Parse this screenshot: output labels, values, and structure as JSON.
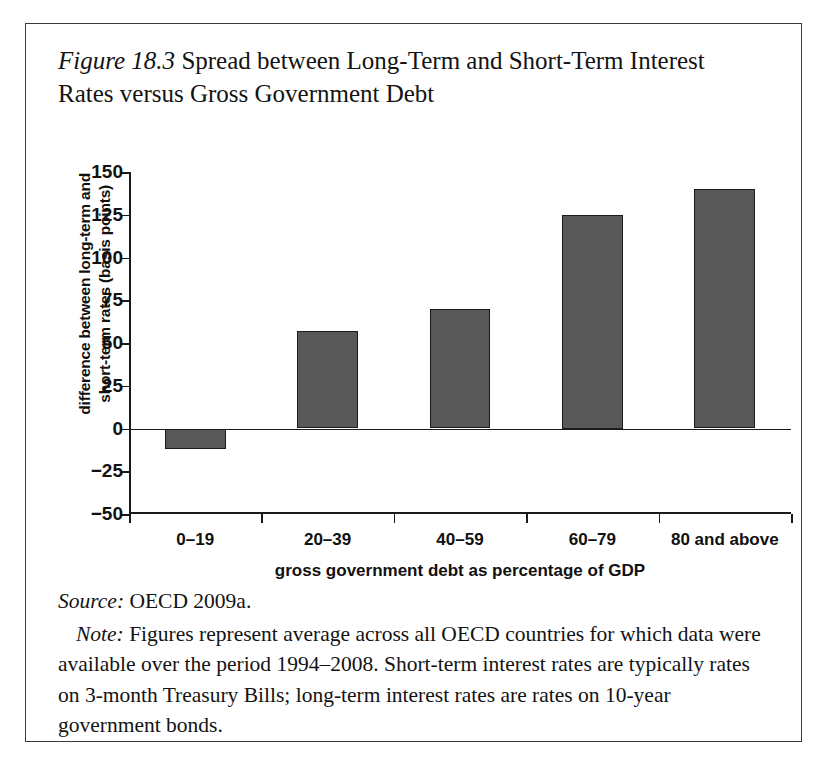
{
  "figure": {
    "number_label": "Figure 18.3",
    "caption": " Spread between Long-Term and Short-Term Interest Rates versus Gross Government Debt",
    "source_lead": "Source:",
    "source_text": " OECD 2009a.",
    "note_lead": "Note:",
    "note_text": " Figures represent average across all OECD countries for which data were available over the period 1994–2008. Short-term interest rates are typically rates on 3-month Treasury Bills; long-term interest rates are rates on 10-year government bonds."
  },
  "chart_data": {
    "type": "bar",
    "title": "Spread between Long-Term and Short-Term Interest Rates versus Gross Government Debt",
    "categories": [
      "0–19",
      "20–39",
      "40–59",
      "60–79",
      "80 and above"
    ],
    "values": [
      -12,
      57,
      70,
      125,
      140
    ],
    "xlabel": "gross government debt as percentage of GDP",
    "ylabel": "difference between long-term and short-term rates (basis points)",
    "ylabel_line1": "difference between long-term and",
    "ylabel_line2": "short-term rates (basis points)",
    "ylim": [
      -50,
      150
    ],
    "yticks": [
      150,
      125,
      100,
      75,
      50,
      25,
      0,
      -25,
      -50
    ],
    "ytick_labels": [
      "150",
      "125",
      "100",
      "75",
      "50",
      "25",
      "0",
      "−25",
      "−50"
    ],
    "grid": false,
    "legend": false,
    "bar_color": "#585858",
    "bar_border_color": "#1c1c1c",
    "axis_color": "#1a1a1a"
  }
}
